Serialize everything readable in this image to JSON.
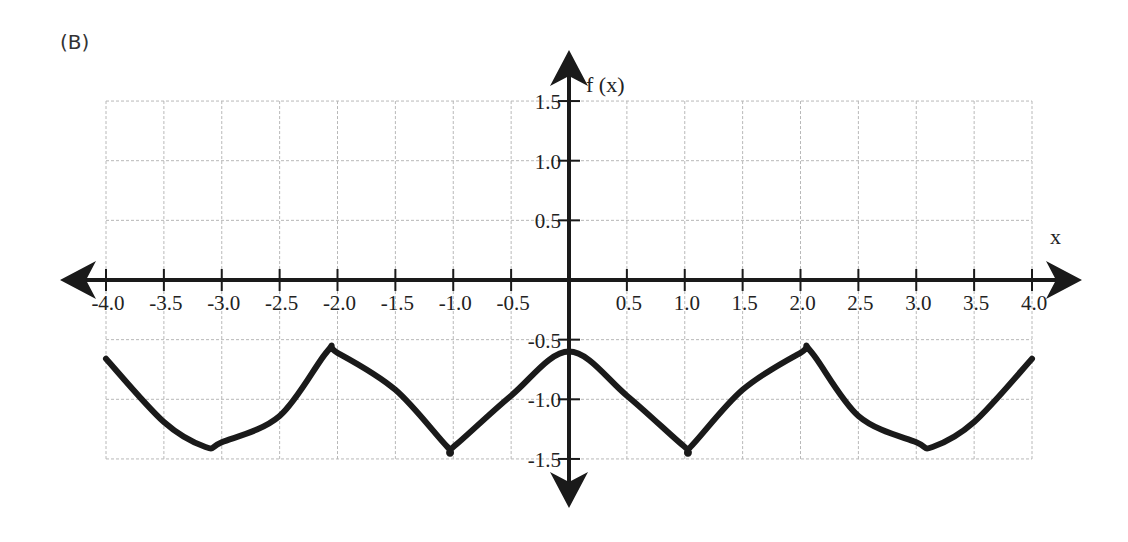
{
  "panel_label": "(B)",
  "chart_data": {
    "type": "line",
    "title": "",
    "panel": "(B)",
    "xlabel": "x",
    "ylabel": "f (x)",
    "xlim": [
      -4.0,
      4.0
    ],
    "ylim": [
      -1.5,
      1.5
    ],
    "grid": true,
    "x_ticks": [
      "-4.0",
      "-3.5",
      "-3.0",
      "-2.5",
      "-2.0",
      "-1.5",
      "-1.0",
      "-0.5",
      "0.5",
      "1.0",
      "1.5",
      "2.0",
      "2.5",
      "3.0",
      "3.5",
      "4.0"
    ],
    "x_tick_values": [
      -4.0,
      -3.5,
      -3.0,
      -2.5,
      -2.0,
      -1.5,
      -1.0,
      -0.5,
      0.5,
      1.0,
      1.5,
      2.0,
      2.5,
      3.0,
      3.5,
      4.0
    ],
    "y_ticks": [
      "1.5",
      "1.0",
      "0.5",
      "-0.5",
      "-1.0",
      "-1.5"
    ],
    "y_tick_values": [
      1.5,
      1.0,
      0.5,
      -0.5,
      -1.0,
      -1.5
    ],
    "series": [
      {
        "name": "f(x) ≈ 0.4·cos(3x) − 1",
        "x": [
          -4.0,
          -3.5,
          -3.14,
          -3.0,
          -2.5,
          -2.09,
          -2.0,
          -1.5,
          -1.05,
          -1.0,
          -0.5,
          0.0,
          0.5,
          1.0,
          1.05,
          1.5,
          2.0,
          2.09,
          2.5,
          3.0,
          3.14,
          3.5,
          4.0
        ],
        "y": [
          -0.66,
          -1.19,
          -1.4,
          -1.36,
          -1.14,
          -0.6,
          -0.61,
          -0.92,
          -1.4,
          -1.4,
          -0.97,
          -0.6,
          -0.97,
          -1.4,
          -1.4,
          -0.92,
          -0.61,
          -0.6,
          -1.14,
          -1.36,
          -1.4,
          -1.19,
          -0.66
        ]
      }
    ],
    "annotations": []
  }
}
